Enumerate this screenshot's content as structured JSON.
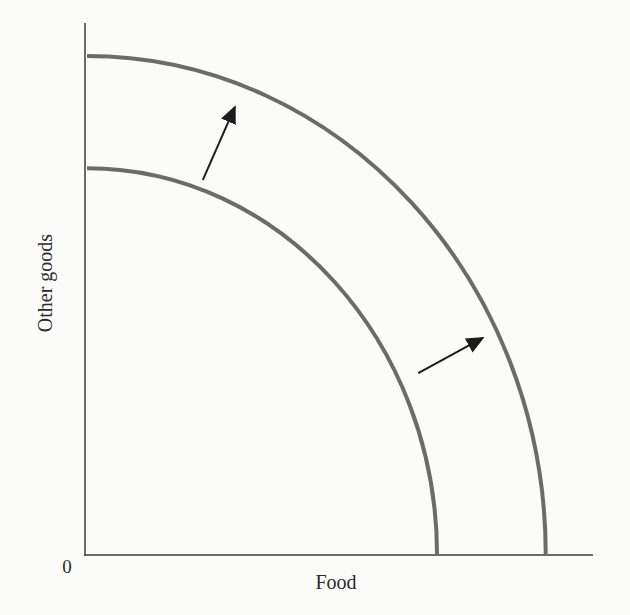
{
  "chart_data": {
    "type": "line",
    "title": "",
    "xlabel": "Food",
    "ylabel": "Other goods",
    "origin_label": "0",
    "axis_range": [
      0,
      10
    ],
    "tick_labels": "none",
    "grid": false,
    "legend": "none",
    "series": [
      {
        "name": "inner frontier (initial PPF)",
        "shape": "quarter-ellipse",
        "x_intercept": 6.93,
        "y_intercept": 7.27
      },
      {
        "name": "outer frontier (shifted PPF)",
        "shape": "quarter-ellipse",
        "x_intercept": 9.07,
        "y_intercept": 9.38
      }
    ],
    "annotations": [
      {
        "type": "arrow",
        "name": "upper shift arrow",
        "from": [
          2.32,
          7.05
        ],
        "to": [
          2.95,
          8.42
        ]
      },
      {
        "type": "arrow",
        "name": "lower shift arrow",
        "from": [
          6.56,
          3.42
        ],
        "to": [
          7.83,
          4.08
        ]
      }
    ]
  },
  "labels": {
    "ylabel": "Other goods",
    "xlabel": "Food",
    "origin": "0"
  },
  "style": {
    "background": "#fbfbf9",
    "curve_color": "#6b6b6b",
    "axis_color": "#3c3c3c",
    "arrow_color": "#1b1b1b",
    "text_color": "#2a2a2a",
    "curve_width": 4,
    "axis_width": 1.5,
    "arrow_width": 2
  }
}
